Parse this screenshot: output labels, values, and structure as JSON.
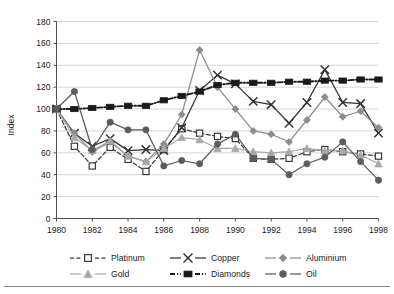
{
  "chart": {
    "type": "line",
    "ylabel": "Index",
    "xlabel": "",
    "title": "",
    "ylim": [
      0,
      180
    ],
    "ytick_step": 20,
    "yticks": [
      "0",
      "20",
      "40",
      "60",
      "80",
      "100",
      "120",
      "140",
      "160",
      "180"
    ],
    "xlim": [
      1980,
      1998
    ],
    "xticks": [
      "1980",
      "1982",
      "1984",
      "1986",
      "1988",
      "1990",
      "1992",
      "1994",
      "1996",
      "1998"
    ],
    "grid": "horizontal",
    "legend_position": "bottom"
  },
  "chart_data": {
    "type": "line",
    "title": "",
    "xlabel": "",
    "ylabel": "Index",
    "ylim": [
      0,
      180
    ],
    "xlim": [
      1980,
      1998
    ],
    "grid": "horizontal",
    "legend_position": "bottom",
    "x": [
      1980,
      1981,
      1982,
      1983,
      1984,
      1985,
      1986,
      1987,
      1988,
      1989,
      1990,
      1991,
      1992,
      1993,
      1994,
      1995,
      1996,
      1997,
      1998
    ],
    "categories": [
      "1980",
      "1981",
      "1982",
      "1983",
      "1984",
      "1985",
      "1986",
      "1987",
      "1988",
      "1989",
      "1990",
      "1991",
      "1992",
      "1993",
      "1994",
      "1995",
      "1996",
      "1997",
      "1998"
    ],
    "series": [
      {
        "name": "Platinum",
        "color": "#3a3a3a",
        "marker": "open-square",
        "dash": "dashed",
        "values": [
          100,
          66,
          48,
          65,
          54,
          43,
          63,
          82,
          78,
          75,
          73,
          55,
          54,
          55,
          61,
          63,
          61,
          59,
          57
        ]
      },
      {
        "name": "Copper",
        "color": "#333333",
        "marker": "x-cross",
        "dash": "solid",
        "values": [
          100,
          78,
          66,
          73,
          62,
          63,
          62,
          83,
          117,
          131,
          123,
          107,
          104,
          87,
          106,
          136,
          106,
          105,
          78
        ]
      },
      {
        "name": "Aluminium",
        "color": "#8c8c8c",
        "marker": "diamond",
        "dash": "solid",
        "values": [
          100,
          78,
          61,
          70,
          57,
          52,
          68,
          95,
          154,
          120,
          100,
          80,
          77,
          70,
          90,
          111,
          93,
          98,
          83
        ]
      },
      {
        "name": "Gold",
        "color": "#a8a8a8",
        "marker": "triangle",
        "dash": "solid",
        "values": [
          100,
          74,
          62,
          71,
          57,
          52,
          64,
          74,
          72,
          64,
          64,
          61,
          60,
          61,
          64,
          62,
          62,
          58,
          50
        ]
      },
      {
        "name": "Diamonds",
        "color": "#1a1a1a",
        "marker": "filled-square",
        "dash": "dash-dot",
        "values": [
          100,
          100,
          101,
          102,
          103,
          103,
          108,
          112,
          116,
          122,
          124,
          124,
          124,
          125,
          125,
          126,
          126,
          127,
          127
        ]
      },
      {
        "name": "Oil",
        "color": "#5c5c5c",
        "marker": "filled-circle",
        "dash": "solid",
        "values": [
          100,
          116,
          63,
          88,
          81,
          81,
          48,
          53,
          50,
          68,
          77,
          55,
          54,
          40,
          50,
          56,
          70,
          52,
          35
        ]
      }
    ]
  },
  "legend": {
    "items": [
      {
        "label": "Platinum"
      },
      {
        "label": "Copper"
      },
      {
        "label": "Aluminium"
      },
      {
        "label": "Gold"
      },
      {
        "label": "Diamonds"
      },
      {
        "label": "Oil"
      }
    ]
  }
}
